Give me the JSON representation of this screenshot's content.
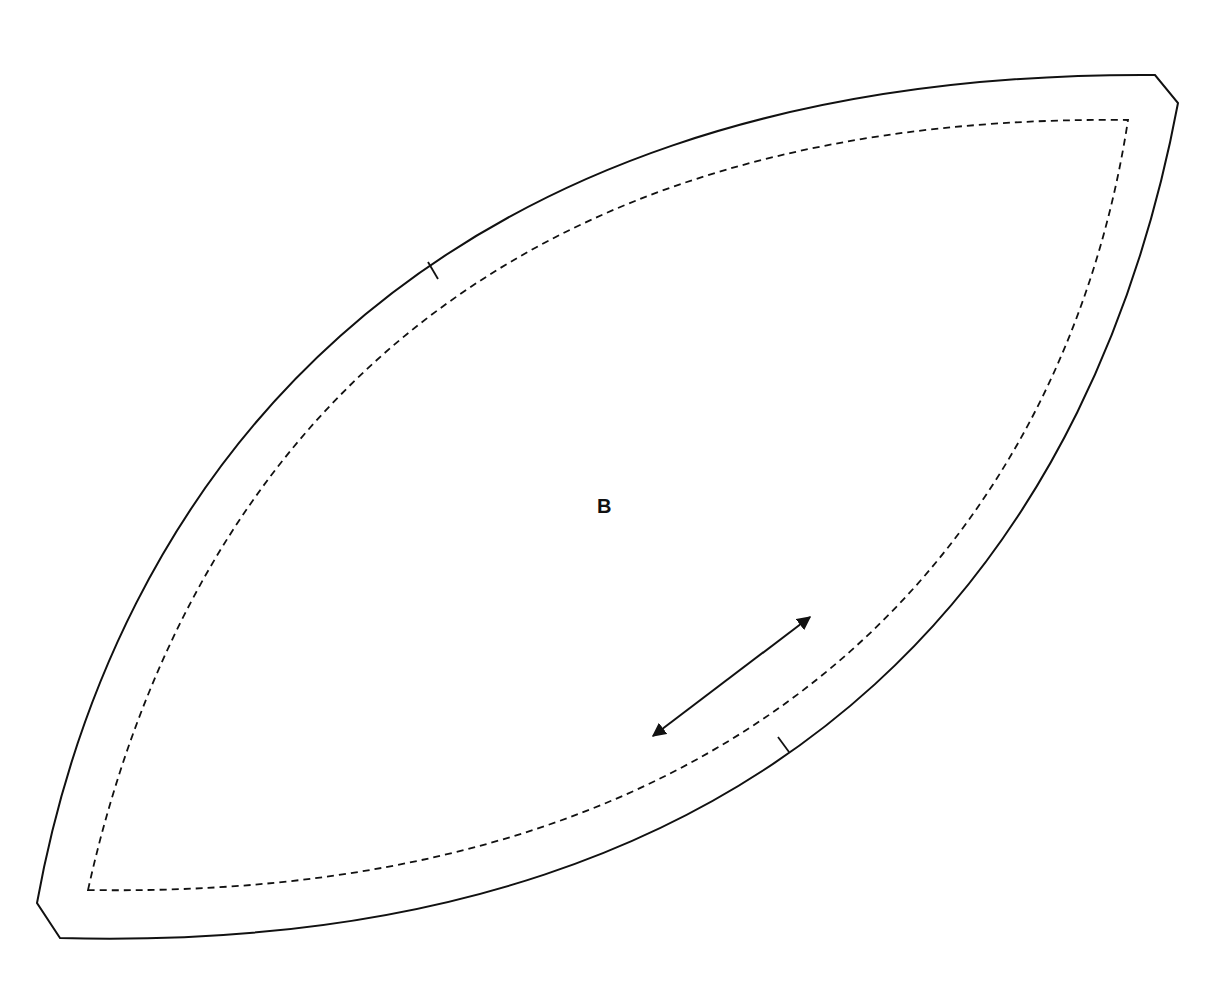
{
  "pattern_piece": {
    "label": "B",
    "cut_line": {
      "description": "Outer cutting line, lens shape with clipped corners",
      "path": "M 60 938 L 37 903 C 110 500, 400 70, 1155 75 L 1178 103 C 1100 520, 820 958, 60 938 Z",
      "color": "#111111"
    },
    "seam_line": {
      "description": "Inner dashed stitching line",
      "path": "M 88 890 C 170 520, 420 112, 1128 120 C 1070 500, 790 902, 88 890 Z",
      "color": "#111111"
    },
    "notches": [
      {
        "name": "notch-upper-left",
        "x1": 428,
        "y1": 262,
        "x2": 438,
        "y2": 279
      },
      {
        "name": "notch-lower-right",
        "x1": 789,
        "y1": 752,
        "x2": 778,
        "y2": 737
      }
    ],
    "grainline": {
      "description": "Double-headed grainline arrow",
      "x1": 653,
      "y1": 736,
      "x2": 810,
      "y2": 617
    }
  }
}
